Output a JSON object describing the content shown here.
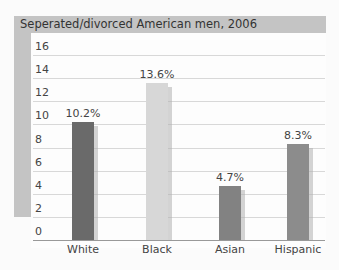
{
  "chart_data": {
    "type": "bar",
    "title": "Seperated/divorced American men, 2006",
    "categories": [
      "White",
      "Black",
      "Asian",
      "Hispanic"
    ],
    "values": [
      10.2,
      13.6,
      4.7,
      8.3
    ],
    "value_labels": [
      "10.2%",
      "13.6%",
      "4.7%",
      "8.3%"
    ],
    "bar_colors": [
      "#6a6a6a",
      "#d7d7d7",
      "#828282",
      "#8c8c8c"
    ],
    "xlabel": "",
    "ylabel": "",
    "ylim": [
      0,
      16
    ],
    "yticks": [
      "0",
      "2",
      "4",
      "6",
      "8",
      "10",
      "12",
      "14",
      "16"
    ],
    "grid": true,
    "legend": null
  }
}
